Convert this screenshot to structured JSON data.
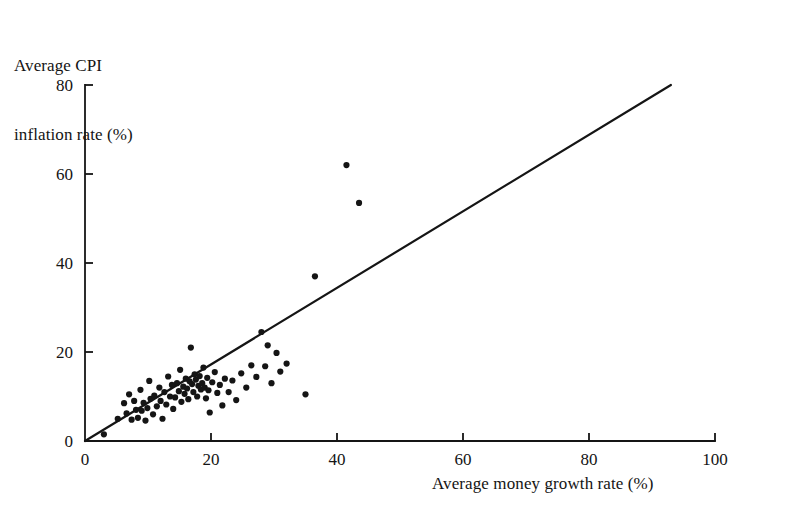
{
  "chart_data": {
    "type": "scatter",
    "title": "",
    "xlabel": "Average money growth rate (%)",
    "ylabel": "Average CPI\ninflation rate (%)",
    "ylabel_line1": "Average CPI",
    "ylabel_line2": "inflation rate (%)",
    "xlim": [
      0,
      100
    ],
    "ylim": [
      0,
      80
    ],
    "xticks": [
      0,
      20,
      40,
      60,
      80,
      100
    ],
    "yticks": [
      0,
      20,
      40,
      60,
      80
    ],
    "xtick_labels": [
      "0",
      "20",
      "40",
      "60",
      "80",
      "100"
    ],
    "ytick_labels": [
      "0",
      "20",
      "40",
      "60",
      "80"
    ],
    "grid": false,
    "legend": null,
    "marker": {
      "shape": "circle",
      "size_px": 4,
      "color": "#151515"
    },
    "reference_line": {
      "label": "45-degree line",
      "x": [
        0,
        93
      ],
      "y": [
        0,
        80
      ],
      "color": "#151515",
      "width_px": 2.2
    },
    "points": [
      [
        3.0,
        1.5
      ],
      [
        5.2,
        5.0
      ],
      [
        6.2,
        8.5
      ],
      [
        6.6,
        6.2
      ],
      [
        7.0,
        10.5
      ],
      [
        7.4,
        4.8
      ],
      [
        7.8,
        9.0
      ],
      [
        8.1,
        7.0
      ],
      [
        8.4,
        5.2
      ],
      [
        8.8,
        11.5
      ],
      [
        9.0,
        6.8
      ],
      [
        9.3,
        8.6
      ],
      [
        9.6,
        4.6
      ],
      [
        9.9,
        7.4
      ],
      [
        10.2,
        13.5
      ],
      [
        10.4,
        9.5
      ],
      [
        10.8,
        6.0
      ],
      [
        11.0,
        10.2
      ],
      [
        11.4,
        7.8
      ],
      [
        11.8,
        12.0
      ],
      [
        12.0,
        9.0
      ],
      [
        12.3,
        5.0
      ],
      [
        12.6,
        11.0
      ],
      [
        12.9,
        8.2
      ],
      [
        13.2,
        14.5
      ],
      [
        13.5,
        10.0
      ],
      [
        13.8,
        12.6
      ],
      [
        14.0,
        7.2
      ],
      [
        14.3,
        9.8
      ],
      [
        14.6,
        13.0
      ],
      [
        14.9,
        11.2
      ],
      [
        15.1,
        16.0
      ],
      [
        15.3,
        8.8
      ],
      [
        15.6,
        12.2
      ],
      [
        15.8,
        10.6
      ],
      [
        16.0,
        14.0
      ],
      [
        16.2,
        11.8
      ],
      [
        16.4,
        9.4
      ],
      [
        16.6,
        13.4
      ],
      [
        16.8,
        21.0
      ],
      [
        17.0,
        12.8
      ],
      [
        17.2,
        11.0
      ],
      [
        17.4,
        15.0
      ],
      [
        17.6,
        13.8
      ],
      [
        17.8,
        10.0
      ],
      [
        18.0,
        12.4
      ],
      [
        18.2,
        14.6
      ],
      [
        18.4,
        11.6
      ],
      [
        18.6,
        13.0
      ],
      [
        18.8,
        16.5
      ],
      [
        19.0,
        12.0
      ],
      [
        19.2,
        9.6
      ],
      [
        19.4,
        14.2
      ],
      [
        19.6,
        11.4
      ],
      [
        19.8,
        6.4
      ],
      [
        20.2,
        13.2
      ],
      [
        20.6,
        15.5
      ],
      [
        21.0,
        10.8
      ],
      [
        21.4,
        12.6
      ],
      [
        21.8,
        8.0
      ],
      [
        22.2,
        14.0
      ],
      [
        22.8,
        11.0
      ],
      [
        23.4,
        13.6
      ],
      [
        24.0,
        9.2
      ],
      [
        24.8,
        15.2
      ],
      [
        25.6,
        12.0
      ],
      [
        26.4,
        17.0
      ],
      [
        27.2,
        14.4
      ],
      [
        28.0,
        24.5
      ],
      [
        28.6,
        16.8
      ],
      [
        29.0,
        21.5
      ],
      [
        29.6,
        13.0
      ],
      [
        30.4,
        19.8
      ],
      [
        31.0,
        15.6
      ],
      [
        32.0,
        17.4
      ],
      [
        35.0,
        10.5
      ],
      [
        36.5,
        37.0
      ],
      [
        41.5,
        62.0
      ],
      [
        43.5,
        53.5
      ]
    ],
    "n_points": 79
  },
  "figure": {
    "background": "#ffffff",
    "axis_color": "#151515"
  }
}
